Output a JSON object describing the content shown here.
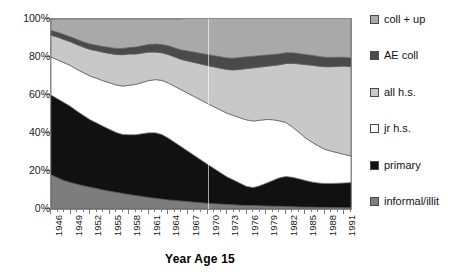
{
  "chart_data": {
    "type": "area",
    "stacked": true,
    "title": "",
    "xlabel": "Year Age 15",
    "ylabel": "",
    "ylim": [
      0,
      100
    ],
    "ytick_labels": [
      "0%",
      "20%",
      "40%",
      "60%",
      "80%",
      "100%"
    ],
    "ytick_values": [
      0,
      20,
      40,
      60,
      80,
      100
    ],
    "grid": false,
    "legend_position": "right",
    "xlim": [
      1946,
      1992
    ],
    "x": [
      1946,
      1947,
      1948,
      1949,
      1950,
      1951,
      1952,
      1953,
      1954,
      1955,
      1956,
      1957,
      1958,
      1959,
      1960,
      1961,
      1962,
      1963,
      1964,
      1965,
      1966,
      1967,
      1968,
      1969,
      1970,
      1971,
      1972,
      1973,
      1974,
      1975,
      1976,
      1977,
      1978,
      1979,
      1980,
      1981,
      1982,
      1983,
      1984,
      1985,
      1986,
      1987,
      1988,
      1989,
      1990,
      1991,
      1992
    ],
    "xtick_labels": [
      "1946",
      "1949",
      "1952",
      "1955",
      "1958",
      "1961",
      "1964",
      "1967",
      "1970",
      "1973",
      "1976",
      "1979",
      "1982",
      "1985",
      "1988",
      "1991"
    ],
    "xtick_values": [
      1946,
      1949,
      1952,
      1955,
      1958,
      1961,
      1964,
      1967,
      1970,
      1973,
      1976,
      1979,
      1982,
      1985,
      1988,
      1991
    ],
    "series": [
      {
        "name": "informal/illit",
        "color": "#7d7d7d",
        "values": [
          18,
          16.5,
          15,
          14,
          13,
          12.2,
          11.5,
          10.8,
          10,
          9.4,
          8.8,
          8.2,
          7.6,
          7.1,
          6.6,
          6.1,
          5.6,
          5.2,
          4.8,
          4.5,
          4.2,
          3.9,
          3.6,
          3.3,
          3.0,
          2.8,
          2.6,
          2.4,
          2.2,
          2.0,
          1.9,
          1.8,
          1.7,
          1.6,
          1.5,
          1.4,
          1.3,
          1.2,
          1.1,
          1.0,
          1.0,
          0.9,
          0.9,
          0.8,
          0.8,
          0.7,
          0.7
        ]
      },
      {
        "name": "primary",
        "color": "#111111",
        "values": [
          42,
          41.5,
          41,
          40,
          38.5,
          37,
          35.5,
          34.5,
          33.5,
          32.5,
          31.5,
          31,
          31.5,
          32,
          33,
          34,
          34.5,
          34,
          32.5,
          30.5,
          28.5,
          26.5,
          24.5,
          22.5,
          20.5,
          18.5,
          16.5,
          14.5,
          13,
          11.5,
          10,
          9.5,
          10.5,
          12,
          13.5,
          15,
          15.8,
          15.5,
          14.8,
          14,
          13.2,
          12.8,
          12.5,
          12.6,
          12.8,
          13,
          13.2
        ]
      },
      {
        "name": "jr h.s.",
        "color": "#ffffff",
        "values": [
          20,
          20.5,
          21,
          21.5,
          22,
          22.5,
          23,
          23.5,
          24,
          24.5,
          25,
          25.5,
          26,
          26.5,
          27,
          27.5,
          28,
          28.5,
          29,
          29.5,
          30,
          30.5,
          31,
          31.5,
          32,
          32.5,
          33,
          33.5,
          34,
          34.5,
          35,
          35,
          34.5,
          33.5,
          32,
          30,
          28.5,
          26.5,
          24.5,
          22.5,
          21,
          19.5,
          18,
          17,
          16,
          15,
          14
        ]
      },
      {
        "name": "all h.s.",
        "color": "#c8c8c8",
        "values": [
          11.5,
          12,
          12.2,
          12.5,
          13,
          13.5,
          14,
          14.5,
          15,
          15.5,
          16,
          16.5,
          16.5,
          16,
          15.5,
          15,
          14.5,
          14.5,
          15,
          15.5,
          16,
          17,
          18,
          19,
          20,
          21,
          22,
          23,
          24,
          25.5,
          27,
          28,
          28,
          28,
          28.5,
          29.5,
          31,
          33.5,
          36,
          38.5,
          40.5,
          42,
          43.5,
          44.5,
          45.5,
          46.5,
          47
        ]
      },
      {
        "name": "AE coll",
        "color": "#4a4a4a",
        "values": [
          2.5,
          2.5,
          2.6,
          2.6,
          2.7,
          2.7,
          2.8,
          2.9,
          3.0,
          3.1,
          3.2,
          3.3,
          3.4,
          3.6,
          3.8,
          4.0,
          4.2,
          4.4,
          4.6,
          4.8,
          5.0,
          5.2,
          5.4,
          5.6,
          5.8,
          5.9,
          6.0,
          6.1,
          6.2,
          6.2,
          6.2,
          6.1,
          6.0,
          5.9,
          5.8,
          5.7,
          5.6,
          5.5,
          5.4,
          5.3,
          5.2,
          5.1,
          5.0,
          4.9,
          4.8,
          4.7,
          4.6
        ]
      },
      {
        "name": "coll + up",
        "color": "#a9a9a9",
        "values": [
          6.0,
          7.0,
          8.2,
          9.4,
          10.8,
          12.1,
          13.2,
          13.8,
          14.5,
          15.0,
          15.5,
          15.5,
          15.0,
          14.8,
          14.1,
          13.4,
          13.2,
          13.4,
          14.1,
          15.2,
          16.3,
          17.9,
          19.5,
          21.1,
          22.7,
          24.3,
          25.9,
          27.5,
          28.6,
          30.3,
          30.9,
          31.6,
          31.3,
          30.0,
          28.7,
          28.4,
          27.8,
          27.8,
          28.2,
          28.7,
          29.1,
          29.7,
          30.1,
          30.2,
          30.1,
          30.1,
          30.5
        ]
      }
    ],
    "legend_entries": [
      {
        "label": "coll + up",
        "color": "#a9a9a9"
      },
      {
        "label": "AE coll",
        "color": "#4a4a4a"
      },
      {
        "label": "all h.s.",
        "color": "#c8c8c8"
      },
      {
        "label": "jr h.s.",
        "color": "#ffffff"
      },
      {
        "label": "primary",
        "color": "#111111"
      },
      {
        "label": "informal/illit",
        "color": "#7d7d7d"
      }
    ]
  }
}
